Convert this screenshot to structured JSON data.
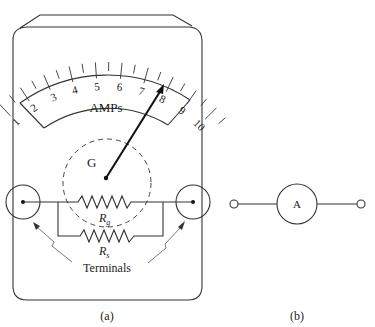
{
  "figure": {
    "panel_a": {
      "caption": "(a)",
      "scale_label": "AMPs",
      "scale_ticks": [
        "1",
        "2",
        "3",
        "4",
        "5",
        "6",
        "7",
        "8",
        "9",
        "10"
      ],
      "galvanometer_label": "G",
      "resistor_g_label": "R",
      "resistor_g_sub": "g",
      "resistor_s_label": "R",
      "resistor_s_sub": "s",
      "terminals_label": "Terminals"
    },
    "panel_b": {
      "caption": "(b)",
      "symbol_label": "A"
    }
  }
}
